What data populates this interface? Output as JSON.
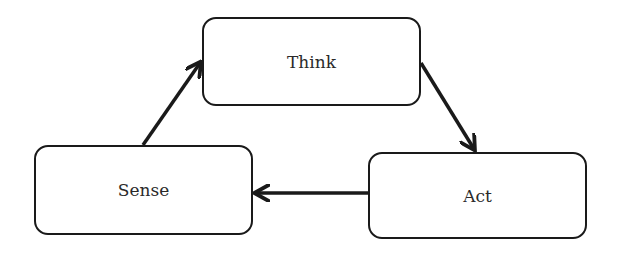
{
  "diagram": {
    "type": "cycle",
    "nodes": [
      {
        "id": "think",
        "label": "Think"
      },
      {
        "id": "act",
        "label": "Act"
      },
      {
        "id": "sense",
        "label": "Sense"
      }
    ],
    "edges": [
      {
        "from": "sense",
        "to": "think"
      },
      {
        "from": "think",
        "to": "act"
      },
      {
        "from": "act",
        "to": "sense"
      }
    ],
    "colors": {
      "stroke": "#1a1a1a",
      "text": "#2a2a2a",
      "background": "#ffffff"
    }
  }
}
